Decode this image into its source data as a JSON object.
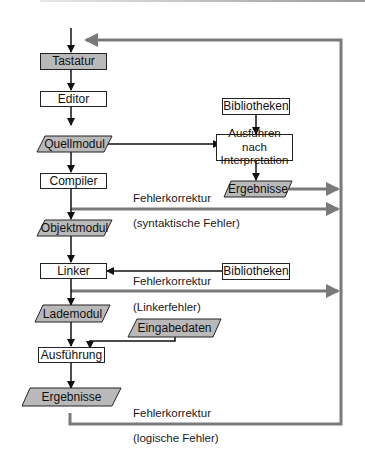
{
  "colors": {
    "box_fill": "#ffffff",
    "shaded_fill": "#b9b9b9",
    "stroke": "#222222",
    "feedback_line": "#7a7a7a"
  },
  "nodes": {
    "tastatur": "Tastatur",
    "editor": "Editor",
    "quellmodul": "Quellmodul",
    "compiler": "Compiler",
    "objektmodul": "Objektmodul",
    "linker": "Linker",
    "lademodul": "Lademodul",
    "ausfuehrung": "Ausführung",
    "ergebnisse_main": "Ergebnisse",
    "bibliotheken_top": "Bibliotheken",
    "interpretation_line1": "Ausführen nach",
    "interpretation_line2": "Interpretation",
    "ergebnisse_interp": "Ergebnisse",
    "bibliotheken_linker": "Bibliotheken",
    "eingabedaten": "Eingabedaten"
  },
  "labels": {
    "fehler_compiler": "Fehlerkorrektur",
    "syntaktisch": "(syntaktische Fehler)",
    "fehler_linker": "Fehlerkorrektur",
    "linkerfehler": "(Linkerfehler)",
    "fehler_logisch": "Fehlerkorrektur",
    "logisch": "(logische Fehler)"
  }
}
